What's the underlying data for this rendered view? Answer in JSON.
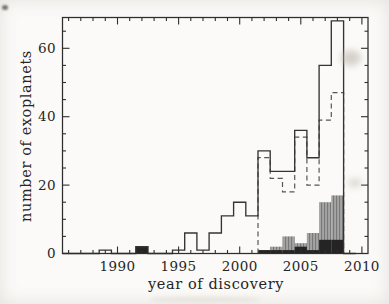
{
  "figure": {
    "background": "#fbfaf8",
    "axis_color": "#2e2e2e",
    "text_color": "#262626",
    "frame": {
      "left": 62.5,
      "right": 368,
      "top": 17.5,
      "bottom": 253.5
    }
  },
  "chart_data": {
    "type": "bar",
    "title": "",
    "xlabel": "year of discovery",
    "ylabel": "number of exoplanets",
    "xlim": [
      1985.5,
      2010.5
    ],
    "ylim": [
      0,
      69
    ],
    "grid": false,
    "legend": "none",
    "x_major_ticks": [
      1990,
      1995,
      2000,
      2005,
      2010
    ],
    "x_minor_tick_step_years": 1,
    "y_major_ticks": [
      0,
      20,
      40,
      60
    ],
    "y_minor_tick_step": 5,
    "bar_width_years": 1,
    "series": [
      {
        "name": "all-exoplanets",
        "style": "step-outline-solid",
        "color": "#343434",
        "years": [
          1986,
          1987,
          1988,
          1989,
          1990,
          1991,
          1992,
          1993,
          1994,
          1995,
          1996,
          1997,
          1998,
          1999,
          2000,
          2001,
          2002,
          2003,
          2004,
          2005,
          2006,
          2007,
          2008,
          2009
        ],
        "values": [
          0,
          0,
          0,
          1,
          0,
          0,
          2,
          0,
          0,
          1,
          6,
          1,
          6,
          11,
          15,
          11,
          30,
          24,
          24,
          36,
          28,
          55,
          68,
          0
        ]
      },
      {
        "name": "radial-velocity-subset",
        "style": "step-outline-dashed",
        "color": "#565656",
        "dash": [
          5,
          3.5
        ],
        "years": [
          2002,
          2003,
          2004,
          2005,
          2006,
          2007,
          2008
        ],
        "values": [
          28,
          22,
          18,
          34,
          20,
          39,
          47
        ]
      },
      {
        "name": "transiting-subset",
        "style": "bar-hatched",
        "color": "#a4a4a4",
        "hatch_color": "#787878",
        "years": [
          2002,
          2003,
          2004,
          2005,
          2006,
          2007,
          2008
        ],
        "values": [
          1,
          2,
          5,
          3,
          6,
          15,
          17
        ]
      },
      {
        "name": "other-methods-subset",
        "style": "bar-solid",
        "color": "#242424",
        "years": [
          1992,
          2002,
          2003,
          2004,
          2005,
          2006,
          2007,
          2008
        ],
        "values": [
          2,
          1,
          1,
          1,
          2,
          1,
          4,
          4
        ]
      }
    ]
  }
}
